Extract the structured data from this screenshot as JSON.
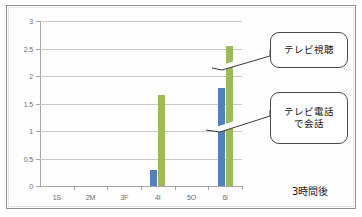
{
  "chart_data": {
    "type": "bar",
    "title": "",
    "xlabel": "",
    "ylabel": "",
    "ylim": [
      0,
      3
    ],
    "yticks": [
      "0",
      "0.5",
      "1",
      "1.5",
      "2",
      "2.5",
      "3"
    ],
    "ytick_values": [
      0,
      0.5,
      1,
      1.5,
      2,
      2.5,
      3
    ],
    "grid": true,
    "legend": "none",
    "categories": [
      "1S",
      "2M",
      "3F",
      "4I",
      "5O",
      "6I"
    ],
    "series": [
      {
        "name": "テレビ電話で会話",
        "color": "#4f81bd",
        "values": [
          0,
          0,
          0,
          0.3,
          0,
          1.78
        ]
      },
      {
        "name": "テレビ視聴",
        "color": "#9bbb59",
        "values": [
          0,
          0,
          0,
          1.65,
          0,
          2.55
        ]
      }
    ],
    "annotations": [
      {
        "id": "callout-tv-viewing",
        "text": "テレビ視聴",
        "points_to": {
          "category": "6I",
          "series": "テレビ視聴",
          "value": 2.55
        }
      },
      {
        "id": "callout-videophone",
        "text_lines": [
          "テレビ電話",
          "で会話"
        ],
        "points_to": {
          "category": "6I",
          "series": "テレビ電話で会話",
          "value": 1.78
        }
      }
    ]
  },
  "labels": {
    "callout_1": "テレビ視聴",
    "callout_2_line_1": "テレビ電話",
    "callout_2_line_2": "で会話",
    "footer_note": "3時間後"
  },
  "colors": {
    "series_blue": "#4f81bd",
    "series_green": "#9bbb59",
    "gridline": "#c9c9c9",
    "axis": "#a6a6a6",
    "tick_label": "#6d6d6d",
    "callout_border": "#4a4a4a",
    "frame": "#8f8f8f"
  }
}
